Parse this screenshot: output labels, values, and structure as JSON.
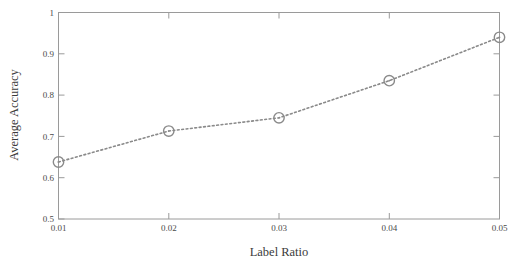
{
  "chart_data": {
    "type": "line",
    "title": "",
    "xlabel": "Label Ratio",
    "ylabel": "Average Accuracy",
    "x": [
      0.01,
      0.02,
      0.03,
      0.04,
      0.05
    ],
    "values": [
      0.638,
      0.713,
      0.745,
      0.835,
      0.94
    ],
    "series": [
      {
        "name": "Average Accuracy",
        "values": [
          0.638,
          0.713,
          0.745,
          0.835,
          0.94
        ]
      }
    ],
    "xtick_labels": [
      "0.01",
      "0.02",
      "0.03",
      "0.04",
      "0.05"
    ],
    "ytick_labels": [
      "0.5",
      "0.6",
      "0.7",
      "0.8",
      "0.9",
      "1"
    ],
    "xtick_values": [
      0.01,
      0.02,
      0.03,
      0.04,
      0.05
    ],
    "ytick_values": [
      0.5,
      0.6,
      0.7,
      0.8,
      0.9,
      1.0
    ],
    "xlim": [
      0.01,
      0.05
    ],
    "ylim": [
      0.5,
      1.0
    ],
    "grid": false,
    "legend": null,
    "line_style": "dotted",
    "marker": "circle-open",
    "colors": {
      "line": "#8a8a8a",
      "marker": "#8a8a8a",
      "axis": "#9a9a9a",
      "text": "#3b3b3b"
    }
  }
}
